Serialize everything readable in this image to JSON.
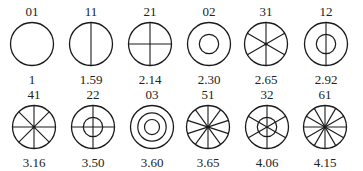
{
  "diagram": {
    "title": "",
    "stroke_color": "#1a1a1a",
    "rows": [
      {
        "items": [
          {
            "mode": "01",
            "value": "1",
            "spokes": 0,
            "inner_rings": 0
          },
          {
            "mode": "11",
            "value": "1.59",
            "spokes": 1,
            "inner_rings": 0
          },
          {
            "mode": "21",
            "value": "2.14",
            "spokes": 2,
            "inner_rings": 0
          },
          {
            "mode": "02",
            "value": "2.30",
            "spokes": 0,
            "inner_rings": 1
          },
          {
            "mode": "31",
            "value": "2.65",
            "spokes": 3,
            "inner_rings": 0
          },
          {
            "mode": "12",
            "value": "2.92",
            "spokes": 1,
            "inner_rings": 1
          }
        ]
      },
      {
        "items": [
          {
            "mode": "41",
            "value": "3.16",
            "spokes": 4,
            "inner_rings": 0
          },
          {
            "mode": "22",
            "value": "3.50",
            "spokes": 2,
            "inner_rings": 1
          },
          {
            "mode": "03",
            "value": "3.60",
            "spokes": 0,
            "inner_rings": 2
          },
          {
            "mode": "51",
            "value": "3.65",
            "spokes": 5,
            "inner_rings": 0
          },
          {
            "mode": "32",
            "value": "4.06",
            "spokes": 3,
            "inner_rings": 1
          },
          {
            "mode": "61",
            "value": "4.15",
            "spokes": 6,
            "inner_rings": 0
          }
        ]
      }
    ]
  }
}
